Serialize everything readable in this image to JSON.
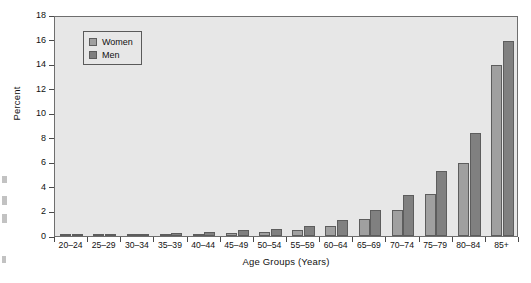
{
  "chart_data": {
    "type": "bar",
    "title": "",
    "subtitle": "",
    "xlabel": "Age Groups (Years)",
    "ylabel": "Percent",
    "ylim": [
      0,
      18
    ],
    "ytick_step": 2,
    "yticks": [
      0,
      2,
      4,
      6,
      8,
      10,
      12,
      14,
      16,
      18
    ],
    "grid": false,
    "legend_position": "top-left inside plot",
    "categories": [
      "20–24",
      "25–29",
      "30–34",
      "35–39",
      "40–44",
      "45–49",
      "50–54",
      "55–59",
      "60–64",
      "65–69",
      "70–74",
      "75–79",
      "80–84",
      "85+"
    ],
    "series": [
      {
        "name": "Women",
        "color": "#a0a0a0",
        "values": [
          0.1,
          0.1,
          0.1,
          0.15,
          0.2,
          0.25,
          0.35,
          0.5,
          0.8,
          1.35,
          2.1,
          3.45,
          5.95,
          13.9
        ]
      },
      {
        "name": "Men",
        "color": "#808080",
        "values": [
          0.15,
          0.15,
          0.15,
          0.25,
          0.3,
          0.45,
          0.6,
          0.85,
          1.3,
          2.15,
          3.3,
          5.3,
          8.4,
          15.9
        ]
      }
    ]
  },
  "legend": {
    "items": [
      {
        "label": "Women",
        "swatch": "women"
      },
      {
        "label": "Men",
        "swatch": "men"
      }
    ]
  },
  "colors": {
    "plot_background": "#e7e7e7",
    "axis": "#4a4a4a",
    "women_bar": "#a0a0a0",
    "men_bar": "#808080",
    "bar_outline": "#5d5d5d"
  }
}
